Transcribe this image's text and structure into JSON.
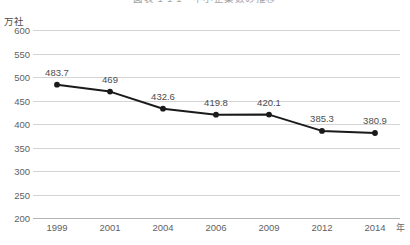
{
  "chart_data": {
    "type": "line",
    "title": "図表 1-1-1　中小企業数の推移",
    "title_visible": false,
    "categories": [
      "1999",
      "2001",
      "2004",
      "2006",
      "2009",
      "2012",
      "2014"
    ],
    "values": [
      483.7,
      469,
      432.6,
      419.8,
      420.1,
      385.3,
      380.9
    ],
    "point_labels": [
      "483.7",
      "469",
      "432.6",
      "419.8",
      "420.1",
      "385.3",
      "380.9"
    ],
    "xlabel": "年",
    "ylabel": "万社",
    "ylim": [
      200,
      600
    ],
    "yticks": [
      600,
      550,
      500,
      450,
      400,
      350,
      300,
      250,
      200
    ],
    "ytick_labels": [
      "600",
      "550",
      "500",
      "450",
      "400",
      "350",
      "300",
      "250",
      "200"
    ],
    "grid": true,
    "legend": false,
    "series_color": "#1a1a1a",
    "grid_color": "#d4d4d4",
    "axis_color": "#b3b3b3",
    "label_color": "#5f5f5f"
  }
}
